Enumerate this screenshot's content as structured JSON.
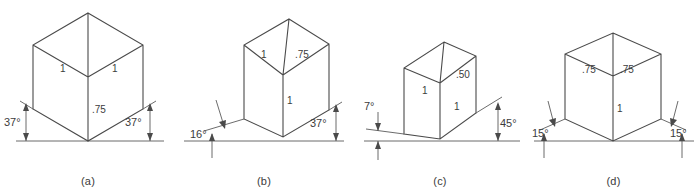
{
  "plate": {
    "title": "Axonometric cube projections",
    "background_color": "#ffffff",
    "line_color": "#4a4a4a",
    "text_color": "#3c3c3c"
  },
  "figures": [
    {
      "id": "a",
      "caption": "(a)",
      "projection": "isometric",
      "angle_left": "37°",
      "angle_right": "37°",
      "edge_top_left": "1",
      "edge_top_right": "1",
      "edge_vertical": ".75",
      "edge_vertical_position": "center"
    },
    {
      "id": "b",
      "caption": "(b)",
      "projection": "dimetric",
      "angle_left": "16°",
      "angle_right": "37°",
      "edge_top_left": "1",
      "edge_top_right": ".75",
      "edge_vertical": "1",
      "edge_vertical_position": "center"
    },
    {
      "id": "c",
      "caption": "(c)",
      "projection": "trimetric",
      "angle_left": "7°",
      "angle_right": "45°",
      "edge_top_left": "1",
      "edge_top_right": ".50",
      "edge_vertical": "1",
      "edge_vertical_position": "right"
    },
    {
      "id": "d",
      "caption": "(d)",
      "projection": "dimetric",
      "angle_left": "15°",
      "angle_right": "15°",
      "edge_top_left": ".75",
      "edge_top_right": ".75",
      "edge_vertical": "1",
      "edge_vertical_position": "center"
    }
  ]
}
